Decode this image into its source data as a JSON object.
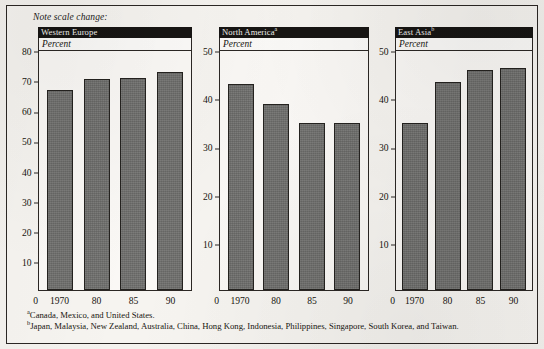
{
  "note": "Note scale change:",
  "axis_unit_label": "Percent",
  "zero_label": "0",
  "footnotes": [
    {
      "marker": "a",
      "text": "Canada, Mexico, and United States."
    },
    {
      "marker": "b",
      "text": "Japan, Malaysia, New Zealand, Australia, China, Hong Kong, Indonesia, Philippines, Singapore, South Korea, and Taiwan."
    }
  ],
  "colors": {
    "bar_fill": "#6f6f6d",
    "bar_border": "#24221f",
    "header_bar": "#171513",
    "header_text": "#f2f1ee",
    "frame": "#2b2724",
    "page_background": "#f4f2ee",
    "plot_background": "#faf8f5"
  },
  "panels": [
    {
      "title": "Western Europe",
      "marker": ""
    },
    {
      "title": "North America",
      "marker": "a"
    },
    {
      "title": "East Asia",
      "marker": "b"
    }
  ],
  "chart_data": [
    {
      "type": "bar",
      "title": "Western Europe",
      "subtitle": "Percent",
      "xlabel": "",
      "ylabel": "Percent",
      "categories": [
        "1970",
        "80",
        "85",
        "90"
      ],
      "values": [
        67,
        70.5,
        71,
        73
      ],
      "ylim": [
        0,
        80
      ],
      "yticks": [
        0,
        10,
        20,
        30,
        40,
        50,
        60,
        70,
        80
      ],
      "grid": false,
      "legend": "none"
    },
    {
      "type": "bar",
      "title": "North America",
      "title_footnote": "a",
      "subtitle": "Percent",
      "xlabel": "",
      "ylabel": "Percent",
      "categories": [
        "1970",
        "80",
        "85",
        "90"
      ],
      "values": [
        43,
        39,
        35,
        35
      ],
      "ylim": [
        0,
        50
      ],
      "yticks": [
        0,
        10,
        20,
        30,
        40,
        50
      ],
      "grid": false,
      "legend": "none"
    },
    {
      "type": "bar",
      "title": "East Asia",
      "title_footnote": "b",
      "subtitle": "Percent",
      "xlabel": "",
      "ylabel": "Percent",
      "categories": [
        "1970",
        "80",
        "85",
        "90"
      ],
      "values": [
        35,
        43.5,
        46,
        46.5
      ],
      "ylim": [
        0,
        50
      ],
      "yticks": [
        0,
        10,
        20,
        30,
        40,
        50
      ],
      "grid": false,
      "legend": "none"
    }
  ]
}
